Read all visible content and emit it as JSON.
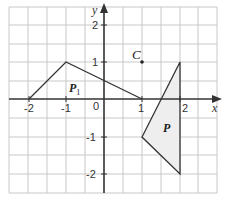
{
  "diagram": {
    "type": "coordinate-grid",
    "x_axis": {
      "label": "x",
      "ticks": [
        {
          "value": -2,
          "label": "-2"
        },
        {
          "value": -1,
          "label": "-1"
        },
        {
          "value": 1,
          "label": "1"
        },
        {
          "value": 2,
          "label": "2"
        }
      ]
    },
    "y_axis": {
      "label": "y",
      "ticks": [
        {
          "value": 2,
          "label": "2"
        },
        {
          "value": 1,
          "label": "1"
        },
        {
          "value": -1,
          "label": "-1"
        },
        {
          "value": -2,
          "label": "-2"
        }
      ]
    },
    "origin_label": "0",
    "grid": {
      "x_range": [
        -2.5,
        3
      ],
      "y_range": [
        -2.5,
        2.5
      ],
      "minor_step": 0.5
    },
    "shapes": [
      {
        "name": "P1",
        "label_main": "P",
        "label_sub": "1",
        "vertices": [
          [
            -2,
            0
          ],
          [
            -1,
            1
          ],
          [
            1,
            0
          ]
        ],
        "fill": "none"
      },
      {
        "name": "P",
        "label_main": "P",
        "label_sub": "",
        "vertices": [
          [
            2,
            1
          ],
          [
            1,
            -1
          ],
          [
            2,
            -2
          ]
        ],
        "fill": "#f0f0f0"
      }
    ],
    "points": [
      {
        "name": "C",
        "label": "C",
        "coords": [
          1,
          1
        ]
      }
    ],
    "colors": {
      "grid": "#c8c8c8",
      "axis": "#333333",
      "shape_stroke": "#333333",
      "shape_fill": "#eeeeee"
    }
  }
}
